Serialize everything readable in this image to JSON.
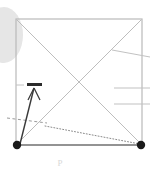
{
  "figure": {
    "title": "",
    "caption": "P",
    "canvas": {
      "width": 153,
      "height": 169,
      "background": "#ffffff"
    },
    "colors": {
      "frame": "#b9b9b9",
      "diagonal": "#bdbdbd",
      "thin_line": "#c2c2c2",
      "dark_bar": "#2b2b2b",
      "arrow": "#3a3a3a",
      "dotted": "#8a8a8a",
      "dashed": "#9a9a9a",
      "node": "#1a1a1a",
      "ellipse": "#e6e6e6",
      "caption": "#d8d8d8"
    },
    "elements": {
      "background_ellipse": {
        "label": "background-ellipse",
        "cx": 4,
        "cy": 35,
        "rx": 19,
        "ry": 28,
        "fill": "#e6e6e6"
      },
      "square_frame": {
        "label": "square-frame",
        "x": 16,
        "y": 19,
        "width": 126,
        "height": 126,
        "stroke": "#b9b9b9",
        "stroke_width": 1.2
      },
      "diagonals": [
        {
          "label": "diagonal-tl-br",
          "x1": 17,
          "y1": 20,
          "x2": 141,
          "y2": 144
        },
        {
          "label": "diagonal-bl-tr",
          "x1": 17,
          "y1": 144,
          "x2": 141,
          "y2": 20
        }
      ],
      "right_ticks": [
        {
          "label": "tick-diagonal-top-right",
          "x1": 112,
          "y1": 50,
          "x2": 150,
          "y2": 57
        },
        {
          "label": "tick-horizontal-upper",
          "x1": 114,
          "y1": 88,
          "x2": 150,
          "y2": 88
        },
        {
          "label": "tick-horizontal-lower",
          "x1": 114,
          "y1": 104,
          "x2": 150,
          "y2": 104
        }
      ],
      "left_tick": {
        "label": "tick-left-edge",
        "x1": 16,
        "y1": 85,
        "x2": 24,
        "y2": 85
      },
      "dark_bar": {
        "label": "load-bar",
        "x": 27,
        "y": 83,
        "width": 15,
        "height": 3,
        "fill": "#2b2b2b"
      },
      "arrow": {
        "label": "force-arrow",
        "shaft_x1": 20,
        "shaft_y1": 144,
        "shaft_x2": 34,
        "shaft_y2": 88,
        "head_left_x": 28,
        "head_left_y": 100,
        "head_right_x": 40,
        "head_right_y": 100,
        "stroke": "#3a3a3a"
      },
      "dashed_line": {
        "label": "dashed-reference-line",
        "x1": 7,
        "y1": 118,
        "x2": 47,
        "y2": 123,
        "dash": "3 2.5"
      },
      "dotted_line": {
        "label": "dotted-deflection-line",
        "x1": 45,
        "y1": 126,
        "x2": 140,
        "y2": 144,
        "dash": "1 2"
      },
      "nodes": [
        {
          "label": "support-node-left",
          "cx": 17,
          "cy": 145,
          "r": 4.2
        },
        {
          "label": "support-node-right",
          "cx": 141,
          "cy": 145,
          "r": 4.2
        }
      ],
      "base_line": {
        "label": "base-line",
        "x1": 17,
        "y1": 145,
        "x2": 141,
        "y2": 145,
        "stroke": "#7d7d7d",
        "stroke_width": 1.6
      }
    }
  }
}
